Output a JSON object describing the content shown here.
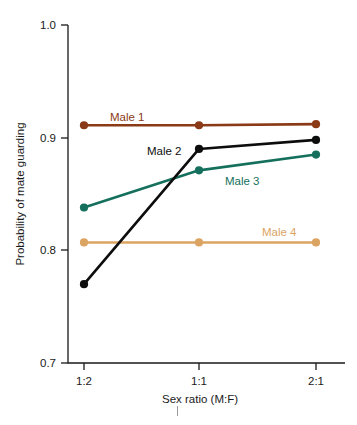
{
  "chart_data": {
    "type": "line",
    "title": "",
    "subtitle": "",
    "xlabel": "Sex ratio (M:F)",
    "ylabel": "Probability of mate guarding",
    "categories": [
      "1:2",
      "1:1",
      "2:1"
    ],
    "x_tick_labels": [
      "1:2",
      "1:1",
      "2:1"
    ],
    "y_tick_labels": [
      "0.7",
      "0.8",
      "0.9",
      "1.0"
    ],
    "y_ticks": [
      0.7,
      0.8,
      0.9,
      1.0
    ],
    "ylim": [
      0.7,
      1.0
    ],
    "grid": false,
    "legend_position": "inline-labels",
    "series": [
      {
        "name": "Male 1",
        "label": "Male 1",
        "color": "#8a3a17",
        "values": [
          0.911,
          0.911,
          0.912
        ],
        "markers": true
      },
      {
        "name": "Male 2",
        "label": "Male 2",
        "color": "#0d0d0d",
        "values": [
          0.77,
          0.89,
          0.898
        ],
        "markers": true
      },
      {
        "name": "Male 3",
        "label": "Male 3",
        "color": "#14705c",
        "values": [
          0.838,
          0.871,
          0.885
        ],
        "markers": true
      },
      {
        "name": "Male 4",
        "label": "Male 4",
        "color": "#dba463",
        "values": [
          0.807,
          0.807,
          0.807
        ],
        "markers": true
      }
    ],
    "annotations": [
      {
        "text": "Male 1",
        "series": "Male 1",
        "color": "#8a3a17"
      },
      {
        "text": "Male 2",
        "series": "Male 2",
        "color": "#0d0d0d"
      },
      {
        "text": "Male 3",
        "series": "Male 3",
        "color": "#14705c"
      },
      {
        "text": "Male 4",
        "series": "Male 4",
        "color": "#dba463"
      }
    ]
  },
  "axis": {
    "y_tick_0": "1.0",
    "y_tick_1": "0.9",
    "y_tick_2": "0.8",
    "y_tick_3": "0.7",
    "x_tick_0": "1:2",
    "x_tick_1": "1:1",
    "x_tick_2": "2:1",
    "x_title": "Sex ratio (M:F)",
    "y_title": "Probability of mate guarding"
  },
  "labels": {
    "male1": "Male 1",
    "male2": "Male 2",
    "male3": "Male 3",
    "male4": "Male 4"
  }
}
